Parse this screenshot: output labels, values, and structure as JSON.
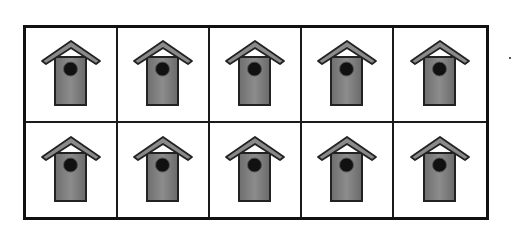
{
  "grid": {
    "rows": 2,
    "columns": 5,
    "total_items": 10,
    "item_type": "birdhouse"
  },
  "colors": {
    "border": "#111111",
    "roof": "#8a8a8a",
    "body": "#7a7a7a",
    "hole": "#111111",
    "outline": "#222222"
  }
}
